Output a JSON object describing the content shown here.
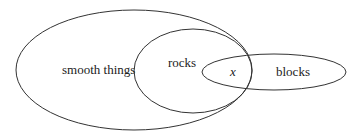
{
  "diagram": {
    "type": "venn",
    "stroke_color": "#333333",
    "background": "#ffffff",
    "sets": [
      {
        "id": "smooth",
        "label": "smooth things",
        "cx": 134,
        "cy": 70,
        "rx": 118,
        "ry": 60,
        "label_x": 62,
        "label_y": 74
      },
      {
        "id": "rocks",
        "label": "rocks",
        "cx": 193,
        "cy": 71,
        "rx": 59,
        "ry": 42,
        "label_x": 168,
        "label_y": 67
      },
      {
        "id": "blocks",
        "label": "blocks",
        "cx": 274,
        "cy": 72,
        "rx": 72,
        "ry": 18,
        "label_x": 276,
        "label_y": 76
      }
    ],
    "element": {
      "label": "x",
      "x": 230,
      "y": 76
    }
  }
}
